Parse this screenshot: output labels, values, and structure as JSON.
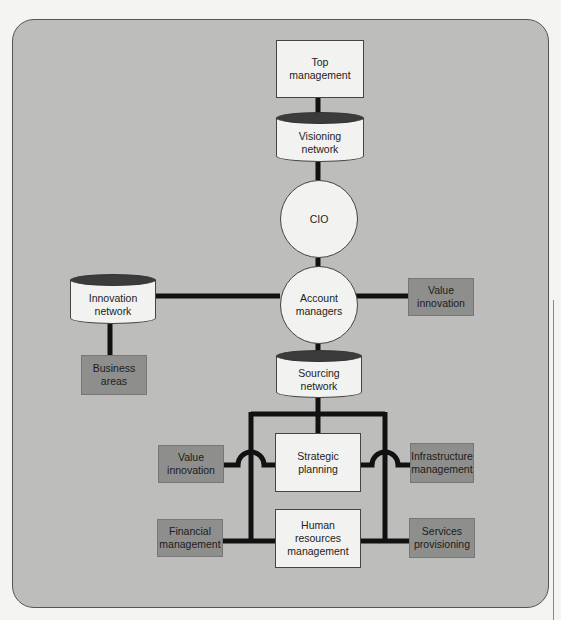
{
  "diagram": {
    "nodes": {
      "top_management": "Top management",
      "visioning_network": "Visioning network",
      "cio": "CIO",
      "account_managers": "Account managers",
      "innovation_network": "Innovation network",
      "business_areas": "Business areas",
      "value_innovation_right": "Value innovation",
      "sourcing_network": "Sourcing network",
      "strategic_planning": "Strategic planning",
      "value_innovation_left": "Value innovation",
      "infrastructure_management": "Infrastructure management",
      "financial_management": "Financial management",
      "human_resources_management": "Human resources management",
      "services_provisioning": "Services provisioning"
    },
    "colors": {
      "background": "#bdbdbb",
      "light_node": "#f2f2f0",
      "dark_node": "#8e8e8c",
      "connector": "#111111"
    }
  }
}
